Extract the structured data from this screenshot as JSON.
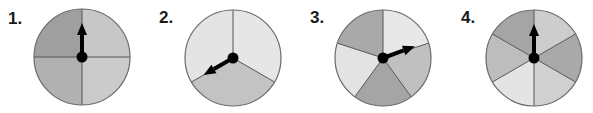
{
  "spinners": [
    {
      "label": "1.",
      "sections": 4,
      "center": [
        82,
        57
      ],
      "radius": 48,
      "arrow_angle_deg": 0,
      "colors": [
        "#c7c7c7",
        "#cbcbcb",
        "#b1b1b1",
        "#9f9f9f"
      ]
    },
    {
      "label": "2.",
      "sections": 3,
      "center": [
        233,
        58
      ],
      "radius": 48,
      "arrow_angle_deg": 240,
      "colors": [
        "#e6e6e6",
        "#c3c3c3",
        "#e4e4e4"
      ]
    },
    {
      "label": "3.",
      "sections": 5,
      "center": [
        383,
        58
      ],
      "radius": 48,
      "arrow_angle_deg": 70,
      "colors": [
        "#e8e8e8",
        "#c0c0c0",
        "#a5a5a5",
        "#e3e3e3",
        "#a9a9a9"
      ]
    },
    {
      "label": "4.",
      "sections": 6,
      "center": [
        534,
        58
      ],
      "radius": 48,
      "arrow_angle_deg": 0,
      "colors": [
        "#cdcdcd",
        "#a9a9a9",
        "#d0d0d0",
        "#e4e4e4",
        "#bdbdbd",
        "#a5a5a5"
      ]
    }
  ],
  "style": {
    "divider_color": "#555555",
    "rim_color": "#6a6a6a",
    "arrow_color": "#000000"
  }
}
